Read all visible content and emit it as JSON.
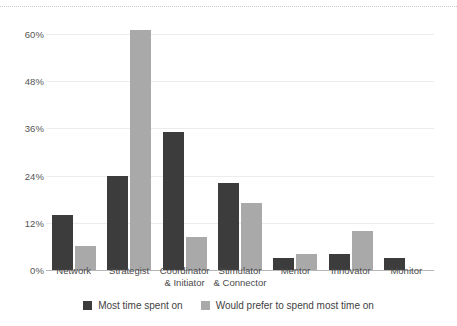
{
  "chart_data": {
    "type": "bar",
    "title": "",
    "xlabel": "",
    "ylabel": "",
    "ylim": [
      0,
      64
    ],
    "grid": true,
    "legend_position": "bottom",
    "y_ticks": [
      "0%",
      "12%",
      "24%",
      "36%",
      "48%",
      "60%"
    ],
    "y_tick_values": [
      0,
      12,
      24,
      36,
      48,
      60
    ],
    "categories": [
      "Network",
      "Strategist",
      "Coordinator & Initiator",
      "Stimulator & Connector",
      "Mentor",
      "Innovator",
      "Monitor"
    ],
    "category_lines": [
      [
        "Network",
        ""
      ],
      [
        "Strategist",
        ""
      ],
      [
        "Coordinator",
        "& Initiator"
      ],
      [
        "Stimulator",
        "& Connector"
      ],
      [
        "Mentor",
        ""
      ],
      [
        "Innovator",
        ""
      ],
      [
        "Monitor",
        ""
      ]
    ],
    "series": [
      {
        "name": "Most time spent on",
        "color": "#3c3c3c",
        "values": [
          14,
          24,
          35,
          22,
          3,
          4,
          3
        ]
      },
      {
        "name": "Would prefer to spend most time on",
        "color": "#a9a9a9",
        "values": [
          6,
          61,
          8.5,
          17,
          4,
          10,
          0
        ]
      }
    ]
  },
  "legend": {
    "items": [
      {
        "label": "Most time spent on",
        "swatch": "dark"
      },
      {
        "label": "Would prefer to spend most time on",
        "swatch": "light"
      }
    ]
  },
  "colors": {
    "series_dark": "#3c3c3c",
    "series_light": "#a9a9a9",
    "gridline": "#ececec",
    "axis": "#b5b5b5",
    "text": "#4a4a4a",
    "background": "#ffffff"
  }
}
